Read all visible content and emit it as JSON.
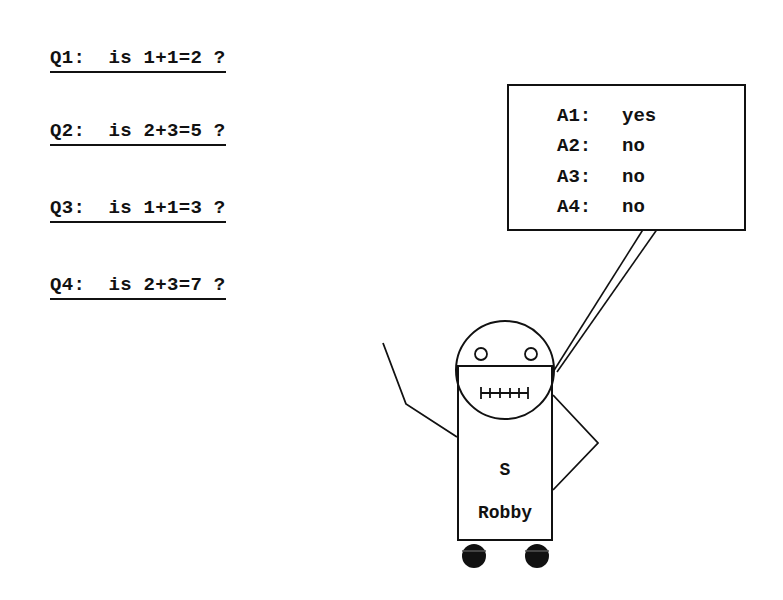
{
  "questions": [
    {
      "label": "Q1:",
      "text": "is 1+1=2 ?"
    },
    {
      "label": "Q2:",
      "text": "is 2+3=5 ?"
    },
    {
      "label": "Q3:",
      "text": "is 1+1=3 ?"
    },
    {
      "label": "Q4:",
      "text": "is 2+3=7 ?"
    }
  ],
  "answers": [
    {
      "label": "A1:",
      "value": "yes"
    },
    {
      "label": "A2:",
      "value": "no"
    },
    {
      "label": "A3:",
      "value": "no"
    },
    {
      "label": "A4:",
      "value": "no"
    }
  ],
  "robot": {
    "badge": "S",
    "name": "Robby"
  },
  "colors": {
    "ink": "#111111",
    "background": "#ffffff"
  }
}
